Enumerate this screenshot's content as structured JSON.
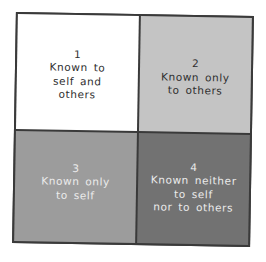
{
  "diagram": {
    "type": "johari-window",
    "colors": {
      "border": "#3a3a3a",
      "q1_bg": "#ffffff",
      "q2_bg": "#c4c4c4",
      "q3_bg": "#9c9c9c",
      "q4_bg": "#727272"
    },
    "quadrants": [
      {
        "number": "1",
        "lines": [
          "Known to",
          "self and",
          "others"
        ]
      },
      {
        "number": "2",
        "lines": [
          "Known only",
          "to others"
        ]
      },
      {
        "number": "3",
        "lines": [
          "Known only",
          "to self"
        ]
      },
      {
        "number": "4",
        "lines": [
          "Known neither",
          "to self",
          "nor to others"
        ]
      }
    ]
  }
}
